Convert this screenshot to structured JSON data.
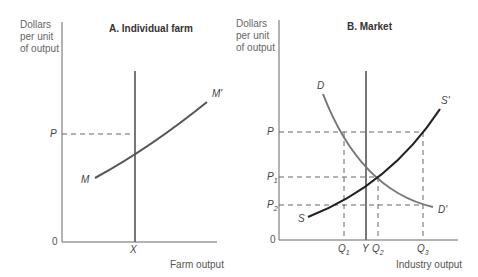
{
  "panel_a": {
    "title": "A.  Individual farm",
    "ylabel": [
      "Dollars",
      "per unit",
      "of output"
    ],
    "xlabel": "Farm output",
    "origin": "0",
    "price_label": "P",
    "quantity_label": "X",
    "curve_start_label": "M",
    "curve_end_label": "M'"
  },
  "panel_b": {
    "title": "B.  Market",
    "ylabel": [
      "Dollars",
      "per unit",
      "of output"
    ],
    "xlabel": "Industry output",
    "origin": "0",
    "price_labels": {
      "p": "P",
      "p1": "P",
      "p1_sub": "1",
      "p2": "P",
      "p2_sub": "2"
    },
    "quantity_labels": {
      "q1": "Q",
      "q1_sub": "1",
      "y": "Y",
      "q2": "Q",
      "q2_sub": "2",
      "q3": "Q",
      "q3_sub": "3"
    },
    "demand_start": "D",
    "demand_end": "D'",
    "supply_start": "S",
    "supply_end": "S'"
  }
}
